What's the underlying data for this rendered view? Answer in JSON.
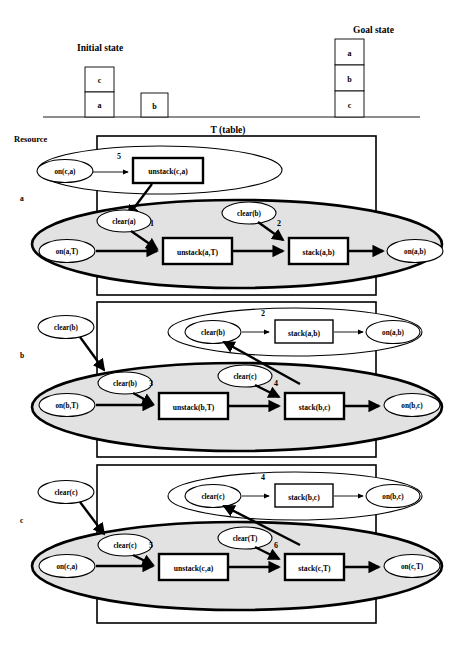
{
  "figure": {
    "initial_state_label": "Initial state",
    "goal_state_label": "Goal state",
    "resource_label": "Resource",
    "table_label": "T (table)"
  },
  "initial_state": {
    "stack1": [
      "c",
      "a"
    ],
    "stack2": [
      "b"
    ]
  },
  "goal_state": {
    "stack": [
      "a",
      "b",
      "c"
    ]
  },
  "resource_rows": [
    {
      "label": "a"
    },
    {
      "label": "b"
    },
    {
      "label": "c"
    }
  ],
  "rows": [
    {
      "id": "row-a",
      "side_label": "a",
      "outer_ellipse": {
        "nodes": [
          {
            "text": "on(c,a)"
          }
        ],
        "action": {
          "text": "unstack(c,a)",
          "number": "5"
        }
      },
      "main_ellipse": {
        "precond_top_left": {
          "text": "clear(a)"
        },
        "precond_top_right": {
          "text": "clear(b)"
        },
        "start_node": {
          "text": "on(a,T)"
        },
        "action1": {
          "text": "unstack(a,T)",
          "number": "1"
        },
        "action2": {
          "text": "stack(a,b)",
          "number": "2"
        },
        "end_node": {
          "text": "on(a,b)"
        }
      }
    },
    {
      "id": "row-b",
      "side_label": "b",
      "external_node": {
        "text": "clear(b)"
      },
      "outer_ellipse": {
        "precond": {
          "text": "clear(b)"
        },
        "action": {
          "text": "stack(a,b)",
          "number": "2"
        },
        "end_node": {
          "text": "on(a,b)"
        }
      },
      "main_ellipse": {
        "precond_top_left": {
          "text": "clear(b)"
        },
        "precond_top_right": {
          "text": "clear(c)"
        },
        "start_node": {
          "text": "on(b,T)"
        },
        "action1": {
          "text": "unstack(b,T)",
          "number": "3"
        },
        "action2": {
          "text": "stack(b,c)",
          "number": "4"
        },
        "end_node": {
          "text": "on(b,c)"
        }
      }
    },
    {
      "id": "row-c",
      "side_label": "c",
      "external_node": {
        "text": "clear(c)"
      },
      "outer_ellipse": {
        "precond": {
          "text": "clear(c)"
        },
        "action": {
          "text": "stack(b,c)",
          "number": "4"
        },
        "end_node": {
          "text": "on(b,c)"
        }
      },
      "main_ellipse": {
        "precond_top_left": {
          "text": "clear(c)"
        },
        "precond_top_right": {
          "text": "clear(T)"
        },
        "start_node": {
          "text": "on(c,a)"
        },
        "action1": {
          "text": "unstack(c,a)",
          "number": "5"
        },
        "action2": {
          "text": "stack(c,T)",
          "number": "6"
        },
        "end_node": {
          "text": "on(c,T)"
        }
      }
    }
  ]
}
